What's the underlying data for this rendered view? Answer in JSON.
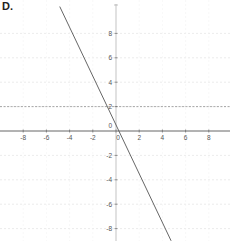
{
  "figure_label": "D.",
  "chart_data": {
    "type": "line",
    "title": "",
    "xlabel": "",
    "ylabel": "",
    "xlim": [
      -10,
      10
    ],
    "ylim": [
      -9,
      10
    ],
    "grid": true,
    "x_ticks": [
      -8,
      -6,
      -4,
      -2,
      0,
      2,
      4,
      6,
      8
    ],
    "y_ticks": [
      8,
      6,
      4,
      2,
      -2,
      -4,
      -6,
      -8
    ],
    "series": [
      {
        "name": "line",
        "equation": "y = -2x + 0.5",
        "x": [
          -4.85,
          4.75
        ],
        "y": [
          10.2,
          -9.0
        ],
        "color": "#555555"
      }
    ],
    "reference_lines": [
      {
        "type": "horizontal",
        "y": 2,
        "style": "dashed"
      }
    ]
  },
  "colors": {
    "axis": "#555555",
    "grid": "#dddddd",
    "line": "#555555",
    "reference": "#888888"
  }
}
